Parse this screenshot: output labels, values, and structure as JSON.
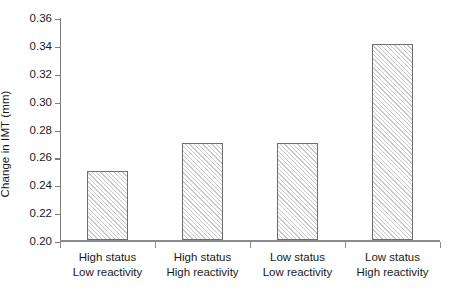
{
  "chart_data": {
    "type": "bar",
    "title": "",
    "xlabel": "",
    "ylabel": "Change in IMT (mm)",
    "categories": [
      "High status\nLow reactivity",
      "High status\nHigh reactivity",
      "Low status\nLow reactivity",
      "Low status\nHigh reactivity"
    ],
    "category_lines": [
      [
        "High status",
        "Low reactivity"
      ],
      [
        "High status",
        "High reactivity"
      ],
      [
        "Low status",
        "Low reactivity"
      ],
      [
        "Low status",
        "High reactivity"
      ]
    ],
    "values": [
      0.25,
      0.27,
      0.27,
      0.341
    ],
    "ylim": [
      0.2,
      0.36
    ],
    "ytick_values": [
      0.2,
      0.22,
      0.24,
      0.26,
      0.28,
      0.3,
      0.32,
      0.34,
      0.36
    ],
    "ytick_labels": [
      "0.20",
      "0.22",
      "0.24",
      "0.26",
      "0.28",
      "0.30",
      "0.32",
      "0.34",
      "0.36"
    ],
    "grid": false,
    "legend": null,
    "bar_fill": "diagonal-hatch",
    "bar_fill_color": "#c9c9c9",
    "bar_edge_color": "#6e6e6e",
    "axis_color": "#8a8a8a",
    "background": "#ffffff"
  }
}
